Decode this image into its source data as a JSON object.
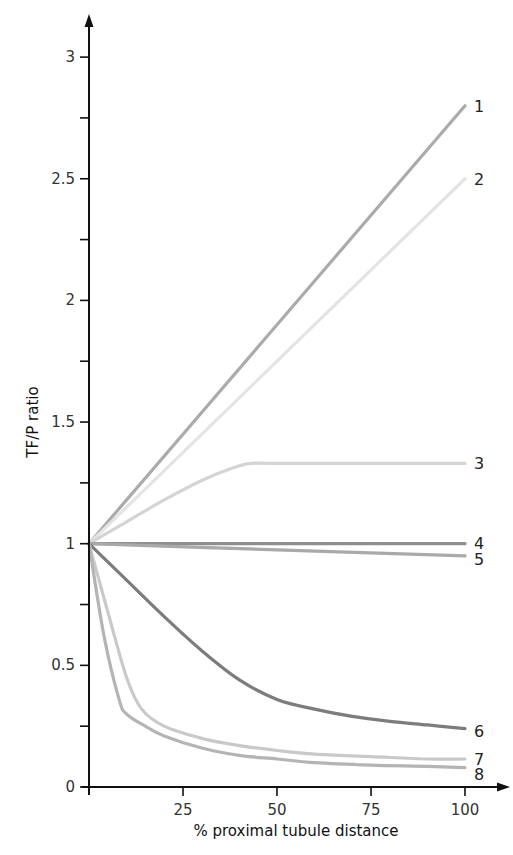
{
  "chart_data": {
    "type": "line",
    "title": "",
    "xlabel": "% proximal tubule distance",
    "ylabel": "TF/P ratio",
    "xlim": [
      0,
      100
    ],
    "ylim": [
      0,
      3
    ],
    "x_ticks": [
      25,
      50,
      75,
      100
    ],
    "x_tick_labels": [
      "25",
      "50",
      "75",
      "100"
    ],
    "y_ticks": [
      0,
      0.5,
      1,
      1.5,
      2,
      2.5,
      3
    ],
    "y_tick_labels": [
      "0",
      "0.5",
      "1",
      "1.5",
      "2",
      "2.5",
      "3"
    ],
    "y_minor_ticks": [
      0.25,
      0.75,
      1.25,
      1.75,
      2.25,
      2.75
    ],
    "grid": false,
    "legend": "inline labels at right end of each line",
    "series": [
      {
        "name": "1",
        "color": "#ababab",
        "x": [
          0,
          100
        ],
        "values": [
          1,
          2.8
        ]
      },
      {
        "name": "2",
        "color": "#e4e4e4",
        "x": [
          0,
          100
        ],
        "values": [
          1,
          2.5
        ]
      },
      {
        "name": "3",
        "color": "#d4d4d4",
        "x": [
          0,
          10,
          20,
          30,
          38,
          43,
          50,
          75,
          100
        ],
        "values": [
          1,
          1.09,
          1.18,
          1.26,
          1.31,
          1.33,
          1.33,
          1.33,
          1.33
        ]
      },
      {
        "name": "4",
        "color": "#8e8e8e",
        "x": [
          0,
          100
        ],
        "values": [
          1,
          1
        ]
      },
      {
        "name": "5",
        "color": "#a9a9a9",
        "x": [
          0,
          50,
          100
        ],
        "values": [
          1,
          0.975,
          0.95
        ]
      },
      {
        "name": "6",
        "color": "#7c7c7c",
        "x": [
          0,
          10,
          20,
          30,
          40,
          50,
          60,
          70,
          80,
          90,
          100
        ],
        "values": [
          1,
          0.85,
          0.7,
          0.56,
          0.44,
          0.36,
          0.32,
          0.29,
          0.27,
          0.255,
          0.24
        ]
      },
      {
        "name": "7",
        "color": "#c9c9c9",
        "x": [
          0,
          5,
          10,
          14,
          20,
          30,
          40,
          50,
          60,
          75,
          90,
          100
        ],
        "values": [
          1,
          0.72,
          0.45,
          0.32,
          0.25,
          0.2,
          0.17,
          0.15,
          0.135,
          0.125,
          0.115,
          0.115
        ]
      },
      {
        "name": "8",
        "color": "#b4b4b4",
        "x": [
          0,
          4,
          8,
          10,
          15,
          20,
          30,
          40,
          50,
          60,
          75,
          90,
          100
        ],
        "values": [
          1,
          0.62,
          0.36,
          0.3,
          0.25,
          0.21,
          0.16,
          0.13,
          0.115,
          0.1,
          0.09,
          0.085,
          0.08
        ]
      }
    ]
  }
}
